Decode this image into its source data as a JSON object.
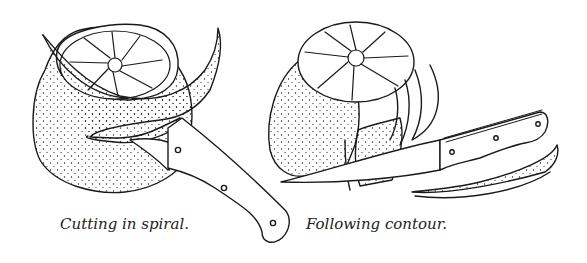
{
  "figures": [
    {
      "id": "left",
      "caption": "Cutting in spiral.",
      "subject": "orange-peeled-in-spiral-with-knife"
    },
    {
      "id": "right",
      "caption": "Following contour.",
      "subject": "orange-peeled-following-contour-with-knife"
    }
  ],
  "colors": {
    "ink": "#1a1a1a",
    "background": "#ffffff"
  }
}
